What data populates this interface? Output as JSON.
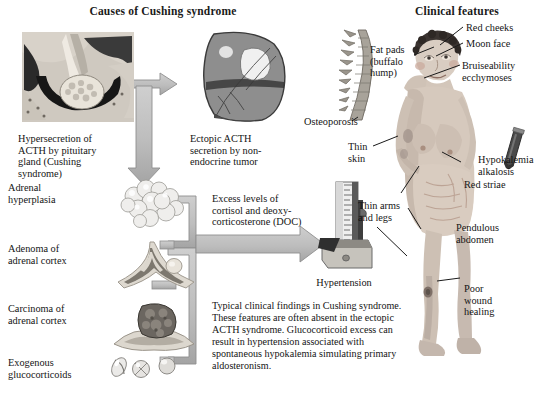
{
  "headings": {
    "left": "Causes of Cushing syndrome",
    "right": "Clinical features"
  },
  "causes_labels": [
    {
      "id": "pituitary",
      "text": "Hypersecretion of\nACTH by pituitary\ngland (Cushing\nsyndrome)"
    },
    {
      "id": "hyperplasia",
      "text": "Adrenal\nhyperplasia"
    },
    {
      "id": "adenoma",
      "text": "Adenoma of\nadrenal cortex"
    },
    {
      "id": "carcinoma",
      "text": "Carcinoma of\nadrenal cortex"
    },
    {
      "id": "exogenous",
      "text": "Exogenous\nglucocorticoids"
    }
  ],
  "ectopic_label": "Ectopic ACTH\nsecretion by non-\nendocrine tumor",
  "excess_label": "Excess levels of\ncortisol and deoxy-\ncorticosterone (DOC)",
  "hypertension_label": "Hypertension",
  "note_paragraph": "Typical clinical findings in Cushing syndrome. These features are often absent in the ectopic ACTH syndrome. Glucocorticoid excess can result in hypertension associated with spontaneous hypokalemia simulating primary aldosteronism.",
  "clinical_labels": [
    {
      "id": "osteoporosis",
      "text": "Osteoporosis"
    },
    {
      "id": "fat-pads",
      "text": "Fat pads\n(buffalo\nhump)"
    },
    {
      "id": "red-cheeks",
      "text": "Red cheeks"
    },
    {
      "id": "moon-face",
      "text": "Moon face"
    },
    {
      "id": "bruiseability",
      "text": "Bruiseability\necchymoses"
    },
    {
      "id": "thin-skin",
      "text": "Thin\nskin"
    },
    {
      "id": "hypokalemia",
      "text": "Hypokalemia\nalkalosis"
    },
    {
      "id": "red-striae",
      "text": "Red striae"
    },
    {
      "id": "thin-limbs",
      "text": "Thin arms\nand legs"
    },
    {
      "id": "pendulous",
      "text": "Pendulous\nabdomen"
    },
    {
      "id": "poor-wound",
      "text": "Poor\nwound\nhealing"
    }
  ],
  "colors": {
    "arrow_fill": "#b9b9b9",
    "arrow_stroke": "#8a8a8a",
    "text": "#141414",
    "background": "#ffffff"
  }
}
